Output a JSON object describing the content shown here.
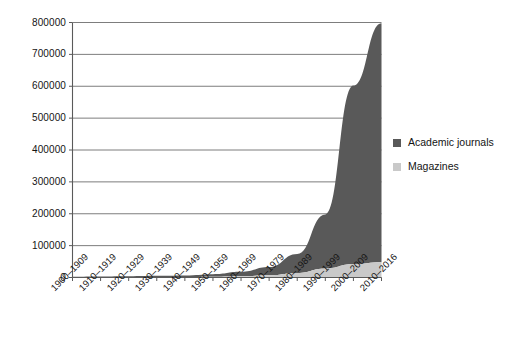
{
  "chart_data": {
    "type": "area",
    "stacked": true,
    "title": "",
    "xlabel": "",
    "ylabel": "",
    "ylim": [
      0,
      800000
    ],
    "grid": true,
    "legend_position": "right",
    "categories": [
      "1900–1909",
      "1910–1919",
      "1920–1929",
      "1930–1939",
      "1940–1949",
      "1950–1959",
      "1960–1969",
      "1970–1979",
      "1980–1989",
      "1990–1999",
      "2000–2009",
      "2010–2016"
    ],
    "ytick_labels": [
      "800000",
      "700000",
      "600000",
      "500000",
      "400000",
      "300000",
      "200000",
      "100000",
      "0"
    ],
    "ytick_values": [
      800000,
      700000,
      600000,
      500000,
      400000,
      300000,
      200000,
      100000,
      0
    ],
    "series": [
      {
        "name": "Academic journals",
        "color": "#595959",
        "values": [
          2000,
          2500,
          3000,
          4000,
          5000,
          8000,
          14000,
          26000,
          60000,
          170000,
          560000,
          750000
        ]
      },
      {
        "name": "Magazines",
        "color": "#c9c9c9",
        "values": [
          500,
          700,
          900,
          1200,
          1600,
          2500,
          4000,
          7000,
          14000,
          28000,
          42000,
          48000
        ]
      }
    ],
    "colors": {
      "academic_journals": "#595959",
      "magazines": "#c9c9c9",
      "gridline": "#6e6e6e",
      "axis": "#5a5a5a",
      "text": "#141414",
      "background": "#ffffff"
    }
  },
  "legend": {
    "items": [
      {
        "label": "Academic journals",
        "swatch": "#595959"
      },
      {
        "label": "Magazines",
        "swatch": "#c9c9c9"
      }
    ]
  }
}
